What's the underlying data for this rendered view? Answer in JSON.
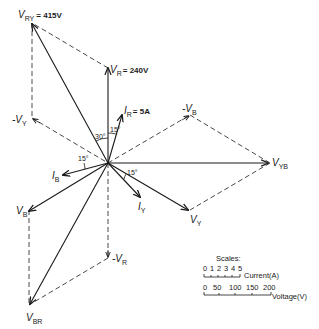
{
  "colors": {
    "ink": "#1a1a1a",
    "background": "#ffffff"
  },
  "phasors": {
    "V_RY": {
      "label": "V",
      "sub": "RY",
      "value": "= 415V"
    },
    "V_R": {
      "label": "V",
      "sub": "R",
      "value": "= 240V"
    },
    "I_R": {
      "label": "I",
      "sub": "R",
      "value": "= 5A"
    },
    "neg_V_B": {
      "label": "-V",
      "sub": "B"
    },
    "neg_V_Y": {
      "label": "-V",
      "sub": "Y"
    },
    "V_YB": {
      "label": "V",
      "sub": "YB"
    },
    "I_B": {
      "label": "I",
      "sub": "B"
    },
    "I_Y": {
      "label": "I",
      "sub": "Y"
    },
    "V_B": {
      "label": "V",
      "sub": "B"
    },
    "V_Y": {
      "label": "V",
      "sub": "Y"
    },
    "neg_V_R": {
      "label": "-V",
      "sub": "R"
    },
    "V_BR": {
      "label": "V",
      "sub": "BR"
    }
  },
  "angles": {
    "a30": "30°",
    "a15_R": "15°",
    "a15_B": "15°",
    "a15_Y": "15°"
  },
  "scales": {
    "title": "Scales:",
    "current": {
      "ticks": [
        "0",
        "1",
        "2",
        "3",
        "4",
        "5"
      ],
      "unit": "Current(A)"
    },
    "voltage": {
      "ticks": [
        "0",
        "50",
        "100",
        "150",
        "200"
      ],
      "unit": "Voltage(V)"
    }
  }
}
